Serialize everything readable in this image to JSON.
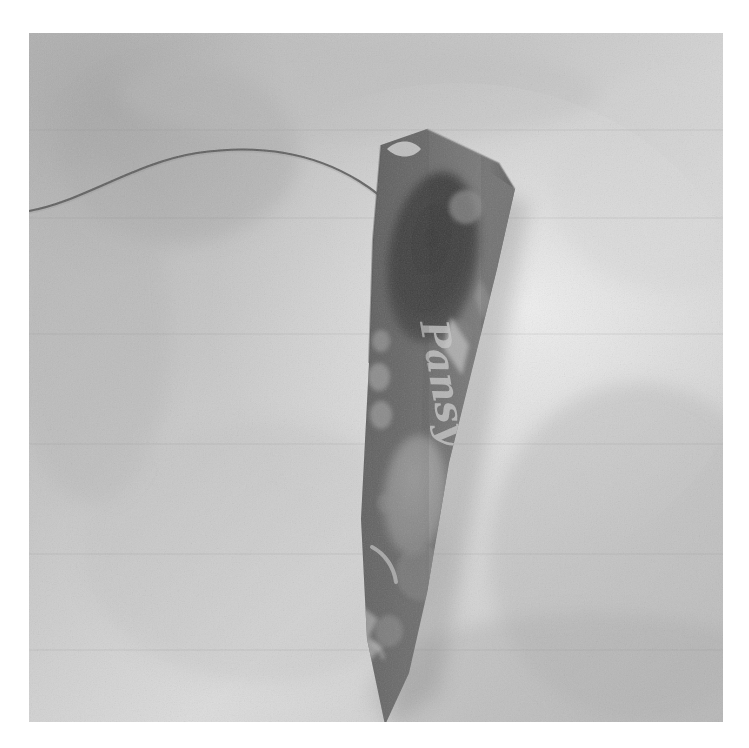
{
  "image": {
    "kind": "photograph",
    "subject": "kite",
    "color_mode": "grayscale",
    "canvas": {
      "width": 749,
      "height": 748,
      "background": "#ffffff"
    },
    "photo_area": {
      "x": 29,
      "y": 33,
      "width": 694,
      "height": 689
    }
  },
  "background": {
    "description": "light gray textured carpet or fabric surface",
    "base_color": "#bdbdbd",
    "highlight_color": "#e3e3e3",
    "shadow_color": "#9a9a9a",
    "grain": "fine film grain speckle",
    "regions": [
      {
        "name": "upper-left-shadow",
        "tone": "#a8a8a8"
      },
      {
        "name": "center-right-highlight",
        "tone": "#e8e8e8"
      },
      {
        "name": "lower-right-shadow-band",
        "tone": "#b0b0b0"
      },
      {
        "name": "lower-left-mid",
        "tone": "#c4c4c4"
      }
    ]
  },
  "objects": {
    "string": {
      "name": "kite-string",
      "color": "#4a4a4a",
      "description": "thin dark thread curving from left edge of photo down to the kite's top corner",
      "path": "M 0 178 C 55 168 105 130 168 120 C 235 110 288 122 330 148 C 362 168 378 188 386 206"
    },
    "kite": {
      "name": "kite-body",
      "shape": "long tapered pennant with pointed top and pointed bottom tip",
      "base_color": "#6d6d6d",
      "edge_highlight": "#8f8f8f",
      "outline": "M 352 112 L 398 96 L 470 130 L 486 156 L 468 236 L 420 430 L 398 560 L 380 640 L 356 692 L 338 606 L 332 486 L 340 330 L 344 206 Z",
      "notch": "small light notch cut at the upper-left edge where the string attaches",
      "label": {
        "text": "Pansy",
        "style": "handwritten script",
        "color": "#c8c8c8",
        "rotation_deg": 80,
        "position": {
          "x": 400,
          "y": 352
        }
      },
      "decoration": {
        "dark_oval": {
          "name": "dark-oval-graphic",
          "color": "#3c3c3c",
          "cx": 404,
          "cy": 222,
          "rx": 44,
          "ry": 84,
          "rotation_deg": 10
        },
        "light_oval": {
          "name": "light-oval-graphic",
          "color": "#9c9c9c",
          "cx": 386,
          "cy": 460,
          "rx": 30,
          "ry": 58,
          "rotation_deg": 6
        },
        "dots": [
          {
            "cx": 437,
            "cy": 174,
            "r": 17,
            "tone": "#8b8b8b"
          },
          {
            "cx": 352,
            "cy": 308,
            "r": 10,
            "tone": "#9a9a9a"
          },
          {
            "cx": 350,
            "cy": 342,
            "r": 12,
            "tone": "#a2a2a2"
          },
          {
            "cx": 351,
            "cy": 380,
            "r": 12,
            "tone": "#a0a0a0"
          },
          {
            "cx": 392,
            "cy": 540,
            "r": 24,
            "tone": "#8a8a8a"
          },
          {
            "cx": 360,
            "cy": 596,
            "r": 14,
            "tone": "#9b9b9b"
          },
          {
            "cx": 430,
            "cy": 300,
            "r": 13,
            "tone": "#7e7e7e"
          }
        ],
        "streak": {
          "name": "light-streak",
          "color": "#b4b4b4",
          "path": "M 421 286 L 438 314 L 432 340 L 414 318 Z"
        },
        "crescent": {
          "name": "crescent-mark",
          "color": "#c0c0c0",
          "path": "M 344 516 C 356 522 364 534 366 548"
        },
        "bottom_patch": {
          "name": "light-bottom-patch",
          "color": "#aeaeae",
          "path": "M 333 576 L 348 588 L 340 606 L 352 616 L 336 632 L 330 604 Z"
        }
      },
      "shadow": {
        "name": "cast-shadow",
        "color": "#8d8d8d",
        "description": "soft shadow falling to the lower-right of the kite"
      }
    }
  },
  "annotations": {
    "text_in_image": [
      "Pansy"
    ],
    "visible_ui_controls": []
  }
}
